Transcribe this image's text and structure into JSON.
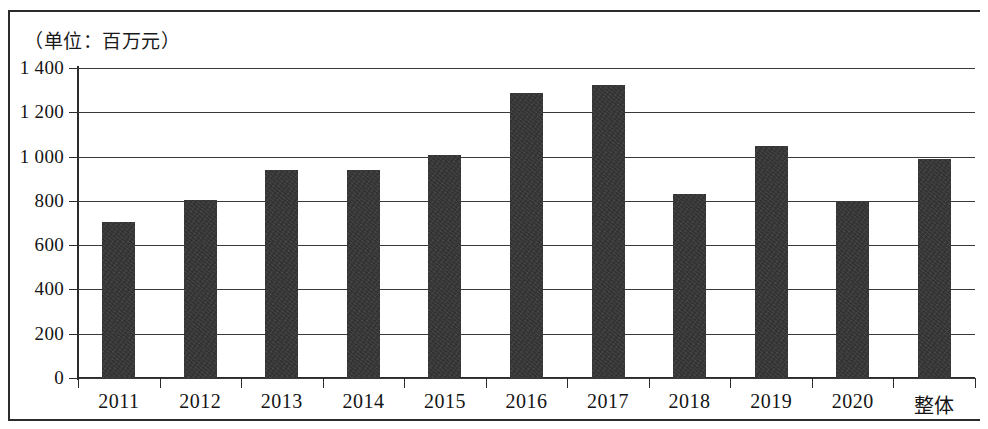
{
  "chart_data": {
    "type": "bar",
    "title": "（单位：百万元）",
    "xlabel": "",
    "ylabel": "",
    "unit_caption": "（单位：百万元）",
    "categories": [
      "2011",
      "2012",
      "2013",
      "2014",
      "2015",
      "2016",
      "2017",
      "2018",
      "2019",
      "2020",
      "整体"
    ],
    "values": [
      705,
      805,
      940,
      940,
      1005,
      1285,
      1325,
      830,
      1050,
      795,
      990
    ],
    "ylim": [
      0,
      1400
    ],
    "ytick_values": [
      0,
      200,
      400,
      600,
      800,
      1000,
      1200,
      1400
    ],
    "ytick_labels": [
      "0",
      "200",
      "400",
      "600",
      "800",
      "1 000",
      "1 200",
      "1 400"
    ],
    "grid": true,
    "legend": null,
    "bar_color": "#333333",
    "axis_color": "#2b2b2b",
    "background_color": "#ffffff"
  }
}
